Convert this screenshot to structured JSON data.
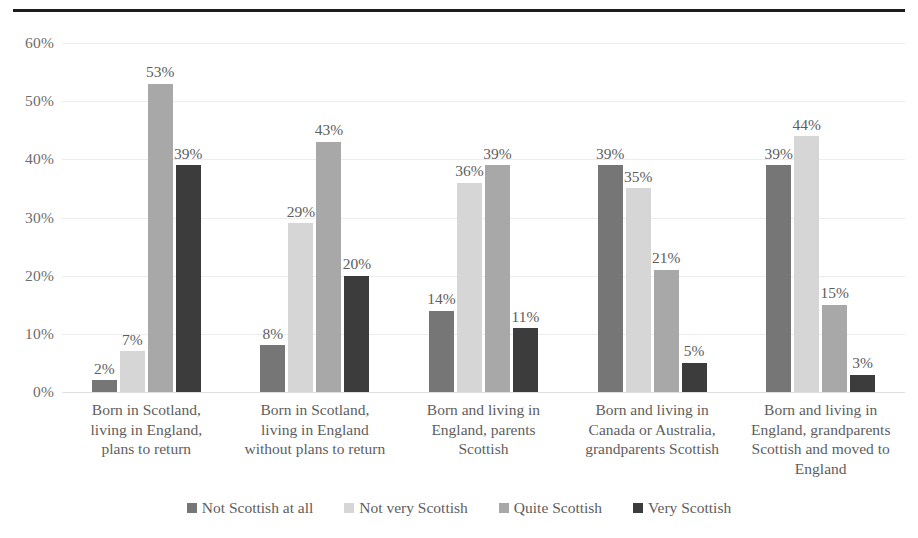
{
  "chart_data": {
    "type": "bar",
    "title": "",
    "subtitle": "",
    "xlabel": "",
    "ylabel": "",
    "ylim": [
      0,
      60
    ],
    "ytick_labels": [
      "60%",
      "50%",
      "40%",
      "30%",
      "20%",
      "10%",
      "0%"
    ],
    "ytick_values": [
      60,
      50,
      40,
      30,
      20,
      10,
      0
    ],
    "grid": true,
    "legend_position": "bottom",
    "value_labels": true,
    "value_label_suffix": "%",
    "categories": [
      "Born in Scotland, living in England, plans to return",
      "Born in Scotland, living in England without plans to return",
      "Born and living in England, parents Scottish",
      "Born and living in Canada or Australia, grandparents Scottish",
      "Born and living in England, grandparents Scottish and moved to England"
    ],
    "category_lines": [
      [
        "Born in Scotland,",
        "living in England,",
        "plans to return"
      ],
      [
        "Born in Scotland,",
        "living in England",
        "without plans to return"
      ],
      [
        "Born and living in",
        "England, parents",
        "Scottish"
      ],
      [
        "Born and living in",
        "Canada or Australia,",
        "grandparents Scottish"
      ],
      [
        "Born and living in",
        "England, grandparents",
        "Scottish and moved to",
        "England"
      ]
    ],
    "series": [
      {
        "name": "Not Scottish at all",
        "color": "#767676",
        "values": [
          2,
          8,
          14,
          39,
          39
        ],
        "labels": [
          "2%",
          "8%",
          "14%",
          "39%",
          "39%"
        ]
      },
      {
        "name": "Not very Scottish",
        "color": "#d6d6d6",
        "values": [
          7,
          29,
          36,
          35,
          44
        ],
        "labels": [
          "7%",
          "29%",
          "36%",
          "35%",
          "44%"
        ]
      },
      {
        "name": "Quite Scottish",
        "color": "#a8a8a8",
        "values": [
          53,
          43,
          39,
          21,
          15
        ],
        "labels": [
          "53%",
          "43%",
          "39%",
          "21%",
          "15%"
        ]
      },
      {
        "name": "Very Scottish",
        "color": "#3c3c3c",
        "values": [
          39,
          20,
          11,
          5,
          3
        ],
        "labels": [
          "39%",
          "20%",
          "11%",
          "5%",
          "3%"
        ]
      }
    ]
  },
  "colors": {
    "not_scottish_at_all": "#767676",
    "not_very_scottish": "#d6d6d6",
    "quite_scottish": "#a8a8a8",
    "very_scottish": "#3c3c3c",
    "gridline": "#ededed",
    "text": "#5e5e5e",
    "rule": "#1c1c1c"
  }
}
